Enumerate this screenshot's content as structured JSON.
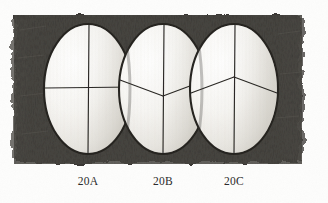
{
  "figure": {
    "medium": "graphite pencil drawing",
    "background_color": "#fdfdfc",
    "shading_color": "#3a3835",
    "egg_fill_color": "#f4f3f0",
    "line_color": "#2a2825",
    "panel": {
      "left": 14,
      "top": 15,
      "right": 302,
      "bottom": 164
    },
    "eggs": [
      {
        "id": "egg-a",
        "label": "20A",
        "cx": 88,
        "cy": 89,
        "rx": 44,
        "ry": 65,
        "marking": "cross",
        "marking_description": "vertical centerline crossed by a horizontal line at mid height"
      },
      {
        "id": "egg-b",
        "label": "20B",
        "cx": 163,
        "cy": 89,
        "rx": 44,
        "ry": 65,
        "marking": "inverted-v",
        "marking_description": "vertical centerline with two arms rising to upper left and upper right from the centre point"
      },
      {
        "id": "egg-c",
        "label": "20C",
        "cx": 234,
        "cy": 89,
        "rx": 44,
        "ry": 65,
        "marking": "y-shape",
        "marking_description": "vertical centerline with two arms descending to lower left and lower right from the centre point"
      }
    ]
  },
  "captions": {
    "a": "20A",
    "b": "20B",
    "c": "20C"
  }
}
